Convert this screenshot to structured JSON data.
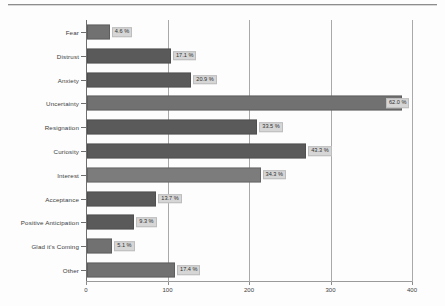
{
  "chart_data": {
    "type": "bar",
    "orientation": "horizontal",
    "title": "",
    "xlabel": "",
    "ylabel": "",
    "xlim": [
      0,
      400
    ],
    "xticks": [
      0,
      100,
      200,
      300,
      400
    ],
    "xtick_labels": [
      "0",
      "100",
      "200",
      "300",
      "400"
    ],
    "grid": true,
    "legend": "none",
    "categories": [
      "Fear",
      "Distrust",
      "Anxiety",
      "Uncertainty",
      "Resignation",
      "Curiosity",
      "Interest",
      "Acceptance",
      "Positive Anticipation",
      "Glad it's Coming",
      "Other"
    ],
    "values": [
      28,
      103,
      128,
      386,
      209,
      269,
      213,
      85,
      58,
      31,
      108
    ],
    "data_labels": [
      "4.6 %",
      "17.1 %",
      "20.9 %",
      "62.0 %",
      "33.5 %",
      "43.3 %",
      "34.3 %",
      "13.7 %",
      "9.3 %",
      "5.1 %",
      "17.4 %"
    ],
    "percentages": [
      4.6,
      17.1,
      20.9,
      62.0,
      33.5,
      43.3,
      34.3,
      13.7,
      9.3,
      5.1,
      17.4
    ],
    "bar_shades": [
      "mid",
      "dark",
      "dark",
      "mid",
      "dark",
      "dark",
      "light",
      "dark",
      "dark",
      "mid",
      "mid"
    ],
    "colors": {
      "bar_dark": "#5a5a5a",
      "bar_mid": "#717171",
      "bar_light": "#7c7c7c",
      "gridline": "#a9a9a9",
      "axis": "#6e6e6e",
      "label_box": "#d6d6d6",
      "text": "#3c3c3c",
      "background": "#fdfdfd"
    }
  }
}
